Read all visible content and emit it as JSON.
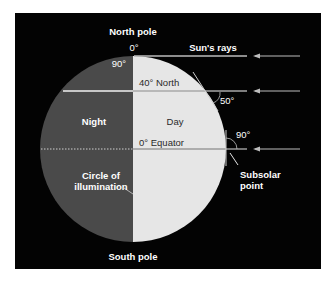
{
  "diagram": {
    "labels": {
      "north_pole": "North pole",
      "south_pole": "South pole",
      "sun_rays": "Sun's rays",
      "zero_deg": "0°",
      "ninety_deg_top": "90°",
      "forty_north": "40° North",
      "fifty_deg": "50°",
      "ninety_deg_right": "90°",
      "night": "Night",
      "day": "Day",
      "equator": "0° Equator",
      "circle_line1": "Circle of",
      "circle_line2": "illumination",
      "subsolar_line1": "Subsolar",
      "subsolar_line2": "point"
    },
    "colors": {
      "background": "#030303",
      "night_side": "#4a4a4a",
      "day_side": "#e6e6e6",
      "rays": "#bdbdbd",
      "text": "#ffffff"
    }
  }
}
